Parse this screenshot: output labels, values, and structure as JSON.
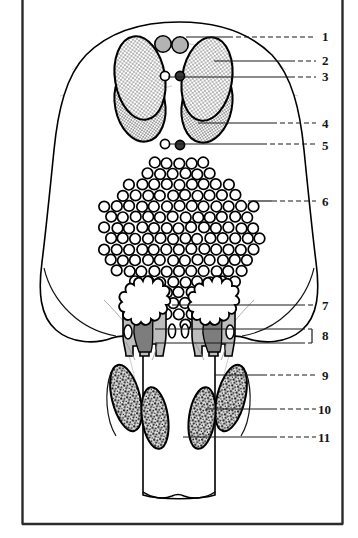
{
  "figure": {
    "frame": {
      "color": "#2b2b2b",
      "left_x": 22,
      "right_x": 343,
      "bottom_y": 524,
      "top_y": 0
    },
    "background_color": "#ffffff",
    "outline_color": "#000000"
  },
  "labels": [
    {
      "id": "1",
      "text": "1",
      "x": 322,
      "y": 30,
      "leader_y": 37,
      "leader_from_x": 186,
      "leader_solid_to_x": 228,
      "style": "line"
    },
    {
      "id": "2",
      "text": "2",
      "x": 322,
      "y": 54,
      "leader_y": 61,
      "leader_from_x": 214,
      "leader_solid_to_x": 290,
      "style": "line"
    },
    {
      "id": "3",
      "text": "3",
      "x": 322,
      "y": 70,
      "leader_y": 77,
      "leader_from_x": 168,
      "leader_solid_to_x": 290,
      "style": "line"
    },
    {
      "id": "4",
      "text": "4",
      "x": 322,
      "y": 117,
      "leader_y": 123,
      "leader_from_x": 198,
      "leader_solid_to_x": 272,
      "style": "line"
    },
    {
      "id": "5",
      "text": "5",
      "x": 322,
      "y": 139,
      "leader_y": 144,
      "leader_from_x": 170,
      "leader_solid_to_x": 262,
      "style": "line"
    },
    {
      "id": "6",
      "text": "6",
      "x": 322,
      "y": 195,
      "leader_y": 201,
      "leader_from_x": 248,
      "leader_solid_to_x": 272,
      "style": "line"
    },
    {
      "id": "7",
      "text": "7",
      "x": 322,
      "y": 299,
      "leader_y": 305,
      "leader_from_x": 172,
      "leader_solid_to_x": 300,
      "style": "line"
    },
    {
      "id": "8",
      "text": "8",
      "x": 322,
      "y": 329,
      "leader_y": 337,
      "leader_from_x": 155,
      "leader_solid_to_x": 300,
      "style": "bracket"
    },
    {
      "id": "9",
      "text": "9",
      "x": 322,
      "y": 369,
      "leader_y": 375,
      "leader_from_x": 215,
      "leader_solid_to_x": 262,
      "style": "line"
    },
    {
      "id": "10",
      "text": "10",
      "x": 318,
      "y": 403,
      "leader_y": 409,
      "leader_from_x": 206,
      "leader_solid_to_x": 272,
      "style": "line"
    },
    {
      "id": "11",
      "text": "11",
      "x": 318,
      "y": 431,
      "leader_y": 437,
      "leader_from_x": 183,
      "leader_solid_to_x": 272,
      "style": "line"
    }
  ],
  "features": {
    "top_gray_circles": {
      "name": "paired gray filled circles",
      "count": 2,
      "fill": "#b3b3b3",
      "stroke": "#000000",
      "positions": [
        {
          "cx": 163,
          "cy": 44,
          "r": 8
        },
        {
          "cx": 180,
          "cy": 45,
          "r": 8
        }
      ]
    },
    "mid_small_circles": {
      "name": "paired small circles below gray pair",
      "count": 2,
      "positions": [
        {
          "cx": 165,
          "cy": 76,
          "r": 5,
          "fill": "#ffffff"
        },
        {
          "cx": 180,
          "cy": 76,
          "r": 5,
          "fill": "#3a3a3a"
        }
      ]
    },
    "lower_small_circles": {
      "name": "paired small circles above cell field",
      "count": 2,
      "positions": [
        {
          "cx": 165,
          "cy": 144,
          "r": 5,
          "fill": "#ffffff"
        },
        {
          "cx": 180,
          "cy": 145,
          "r": 5,
          "fill": "#3a3a3a"
        }
      ]
    },
    "upper_stippled_ovals": {
      "name": "large paired stippled ovals",
      "count": 2,
      "fill_pattern": "fine-dot-stipple",
      "fill": "#f2f2f2",
      "stroke": "#000000"
    },
    "lower_lobes": {
      "name": "overlapping lower stippled lobes",
      "count": 2,
      "fill_pattern": "fine-dot-stipple"
    },
    "cell_field": {
      "name": "hexagonal array of open ring cells",
      "ring_stroke": "#000000",
      "ring_fill": "#ffffff",
      "approx_count": 180
    },
    "tooth_structures": {
      "name": "paired crown-and-root structures",
      "count": 2,
      "crown_fill": "#ffffff",
      "body_fill": "#bcbcbc",
      "core_fill": "#7a7a7a",
      "stroke": "#000000"
    },
    "central_small_ovals": {
      "name": "central pair of small ovals between structures",
      "count": 2
    },
    "bottom_coarse_ovals": {
      "name": "coarse-stippled elongated ovals",
      "count": 4,
      "fill_pattern": "coarse-dot-stipple",
      "stroke": "#000000"
    }
  }
}
